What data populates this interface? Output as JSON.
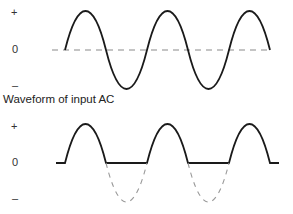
{
  "top_graph": {
    "y_labels": {
      "plus": "+",
      "zero": "0",
      "minus": "–"
    },
    "caption": "Waveform of input AC",
    "colors": {
      "wave": "#1a1a1a",
      "axis_dashed": "#8a8a8a"
    }
  },
  "bottom_graph": {
    "y_labels": {
      "plus": "+",
      "zero": "0",
      "minus": "–"
    },
    "colors": {
      "wave": "#1a1a1a",
      "suppressed_dashed": "#9a9a9a"
    }
  }
}
